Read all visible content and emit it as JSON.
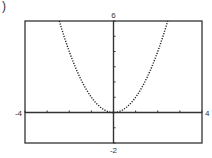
{
  "part_label": ")",
  "chart_data": {
    "type": "line",
    "title": "",
    "function": "y = x^2",
    "xlabel": "",
    "ylabel": "",
    "xlim": [
      -4,
      4
    ],
    "ylim": [
      -2,
      6
    ],
    "x_tick_step": 1,
    "y_tick_step": 1,
    "grid": false,
    "line_style": "dotted",
    "window_labels": {
      "xmin": "-4",
      "xmax": "4",
      "ymin": "-2",
      "ymax": "6"
    },
    "series": [
      {
        "name": "y = x^2",
        "x": [
          -2.45,
          -2,
          -1.5,
          -1,
          -0.5,
          0,
          0.5,
          1,
          1.5,
          2,
          2.45
        ],
        "y": [
          6,
          4,
          2.25,
          1,
          0.25,
          0,
          0.25,
          1,
          2.25,
          4,
          6
        ]
      }
    ]
  }
}
